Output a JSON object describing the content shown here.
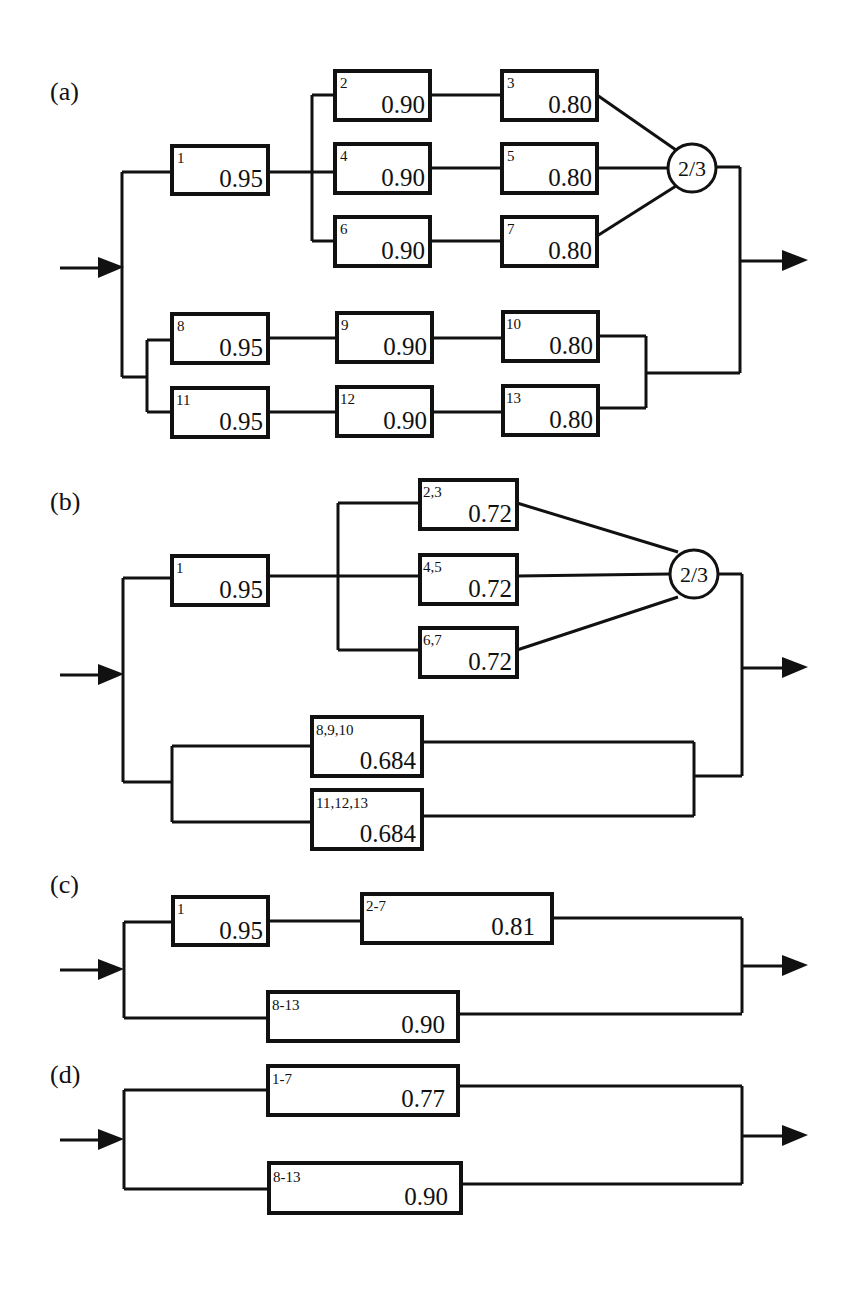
{
  "panels": {
    "a": {
      "label": "(a)",
      "blocks": {
        "b1": {
          "id": "1",
          "value": "0.95"
        },
        "b2": {
          "id": "2",
          "value": "0.90"
        },
        "b3": {
          "id": "3",
          "value": "0.80"
        },
        "b4": {
          "id": "4",
          "value": "0.90"
        },
        "b5": {
          "id": "5",
          "value": "0.80"
        },
        "b6": {
          "id": "6",
          "value": "0.90"
        },
        "b7": {
          "id": "7",
          "value": "0.80"
        },
        "b8": {
          "id": "8",
          "value": "0.95"
        },
        "b9": {
          "id": "9",
          "value": "0.90"
        },
        "b10": {
          "id": "10",
          "value": "0.80"
        },
        "b11": {
          "id": "11",
          "value": "0.95"
        },
        "b12": {
          "id": "12",
          "value": "0.90"
        },
        "b13": {
          "id": "13",
          "value": "0.80"
        }
      },
      "vote": "2/3"
    },
    "b": {
      "label": "(b)",
      "blocks": {
        "b1": {
          "id": "1",
          "value": "0.95"
        },
        "b23": {
          "id": "2,3",
          "value": "0.72"
        },
        "b45": {
          "id": "4,5",
          "value": "0.72"
        },
        "b67": {
          "id": "6,7",
          "value": "0.72"
        },
        "b8910": {
          "id": "8,9,10",
          "value": "0.684"
        },
        "b111213": {
          "id": "11,12,13",
          "value": "0.684"
        }
      },
      "vote": "2/3"
    },
    "c": {
      "label": "(c)",
      "blocks": {
        "b1": {
          "id": "1",
          "value": "0.95"
        },
        "b27": {
          "id": "2-7",
          "value": "0.81"
        },
        "b813": {
          "id": "8-13",
          "value": "0.90"
        }
      }
    },
    "d": {
      "label": "(d)",
      "blocks": {
        "b17": {
          "id": "1-7",
          "value": "0.77"
        },
        "b813": {
          "id": "8-13",
          "value": "0.90"
        }
      }
    }
  }
}
